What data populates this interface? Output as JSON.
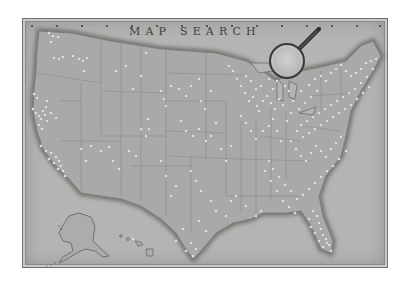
{
  "map": {
    "title": "MAP SEARCH",
    "colors": {
      "frame_bg": "#b4b4b2",
      "land": "#a9a9a7",
      "coast_shadow": "#6a6a68",
      "state_lines": "#8c8c8a",
      "pin": "#f2f2f0",
      "magnifier_handle": "#3a3a3a",
      "magnifier_lens": "#c4c4c2"
    },
    "scale_ticks": [
      "",
      "",
      "",
      "",
      "",
      "",
      "",
      "",
      "",
      "",
      "",
      "",
      "",
      "",
      ""
    ],
    "magnifier_icon": "magnifying-glass-icon",
    "regions": [
      "contiguous-us",
      "alaska",
      "hawaii"
    ],
    "pin_clusters": [
      {
        "region": "pacific-northwest",
        "pins": [
          [
            48,
            32
          ],
          [
            52,
            35
          ],
          [
            57,
            36
          ],
          [
            50,
            41
          ],
          [
            53,
            57
          ],
          [
            58,
            58
          ],
          [
            62,
            56
          ],
          [
            72,
            55
          ],
          [
            78,
            58
          ],
          [
            82,
            60
          ],
          [
            86,
            57
          ],
          [
            83,
            70
          ]
        ]
      },
      {
        "region": "california",
        "pins": [
          [
            33,
            93
          ],
          [
            36,
            97
          ],
          [
            32,
            108
          ],
          [
            35,
            112
          ],
          [
            38,
            115
          ],
          [
            40,
            118
          ],
          [
            42,
            110
          ],
          [
            44,
            114
          ],
          [
            46,
            120
          ],
          [
            38,
            124
          ],
          [
            41,
            128
          ],
          [
            45,
            106
          ],
          [
            50,
            112
          ],
          [
            55,
            117
          ],
          [
            46,
            100
          ],
          [
            40,
            145
          ],
          [
            45,
            150
          ],
          [
            50,
            152
          ],
          [
            55,
            156
          ],
          [
            58,
            160
          ],
          [
            60,
            165
          ],
          [
            62,
            170
          ],
          [
            57,
            168
          ],
          [
            53,
            162
          ],
          [
            48,
            158
          ],
          [
            64,
            175
          ]
        ]
      },
      {
        "region": "mountain-west",
        "pins": [
          [
            80,
            148
          ],
          [
            85,
            160
          ],
          [
            90,
            145
          ],
          [
            100,
            150
          ],
          [
            108,
            146
          ],
          [
            112,
            160
          ],
          [
            118,
            168
          ],
          [
            128,
            150
          ],
          [
            135,
            155
          ],
          [
            140,
            128
          ],
          [
            145,
            135
          ],
          [
            148,
            128
          ],
          [
            147,
            118
          ],
          [
            115,
            70
          ],
          [
            125,
            65
          ],
          [
            132,
            88
          ],
          [
            140,
            75
          ],
          [
            145,
            52
          ]
        ]
      },
      {
        "region": "plains",
        "pins": [
          [
            160,
            90
          ],
          [
            163,
            98
          ],
          [
            165,
            105
          ],
          [
            170,
            85
          ],
          [
            178,
            88
          ],
          [
            185,
            95
          ],
          [
            190,
            85
          ],
          [
            198,
            78
          ],
          [
            200,
            100
          ],
          [
            204,
            108
          ],
          [
            210,
            90
          ],
          [
            180,
            120
          ],
          [
            185,
            130
          ],
          [
            192,
            135
          ],
          [
            198,
            128
          ],
          [
            205,
            140
          ],
          [
            210,
            135
          ],
          [
            215,
            122
          ],
          [
            220,
            148
          ],
          [
            225,
            160
          ],
          [
            230,
            145
          ],
          [
            190,
            170
          ],
          [
            195,
            180
          ],
          [
            200,
            190
          ],
          [
            210,
            200
          ],
          [
            215,
            210
          ],
          [
            198,
            220
          ],
          [
            205,
            230
          ],
          [
            175,
            240
          ],
          [
            182,
            228
          ],
          [
            170,
            195
          ],
          [
            175,
            185
          ],
          [
            165,
            175
          ],
          [
            160,
            160
          ]
        ]
      },
      {
        "region": "texas-gulf",
        "pins": [
          [
            185,
            250
          ],
          [
            190,
            242
          ],
          [
            192,
            255
          ],
          [
            195,
            248
          ],
          [
            225,
            215
          ],
          [
            230,
            200
          ],
          [
            235,
            195
          ],
          [
            245,
            205
          ],
          [
            255,
            215
          ],
          [
            260,
            210
          ]
        ]
      },
      {
        "region": "midwest-great-lakes",
        "pins": [
          [
            228,
            65
          ],
          [
            232,
            70
          ],
          [
            236,
            78
          ],
          [
            240,
            85
          ],
          [
            244,
            92
          ],
          [
            248,
            100
          ],
          [
            252,
            96
          ],
          [
            256,
            105
          ],
          [
            258,
            110
          ],
          [
            262,
            100
          ],
          [
            266,
            95
          ],
          [
            270,
            102
          ],
          [
            274,
            108
          ],
          [
            278,
            98
          ],
          [
            282,
            104
          ],
          [
            272,
            88
          ],
          [
            276,
            80
          ],
          [
            280,
            75
          ],
          [
            268,
            78
          ],
          [
            260,
            85
          ],
          [
            255,
            88
          ],
          [
            250,
            80
          ],
          [
            245,
            75
          ],
          [
            240,
            115
          ],
          [
            245,
            122
          ],
          [
            250,
            130
          ],
          [
            255,
            138
          ],
          [
            262,
            130
          ],
          [
            268,
            125
          ],
          [
            272,
            118
          ],
          [
            276,
            130
          ],
          [
            280,
            140
          ],
          [
            286,
            120
          ],
          [
            290,
            112
          ],
          [
            284,
            85
          ],
          [
            288,
            90
          ]
        ]
      },
      {
        "region": "northeast",
        "pins": [
          [
            320,
            75
          ],
          [
            325,
            80
          ],
          [
            330,
            72
          ],
          [
            335,
            68
          ],
          [
            340,
            64
          ],
          [
            345,
            70
          ],
          [
            350,
            75
          ],
          [
            355,
            72
          ],
          [
            360,
            68
          ],
          [
            365,
            62
          ],
          [
            370,
            60
          ],
          [
            375,
            58
          ],
          [
            372,
            68
          ],
          [
            366,
            76
          ],
          [
            360,
            82
          ],
          [
            354,
            88
          ],
          [
            348,
            92
          ],
          [
            342,
            96
          ],
          [
            336,
            100
          ],
          [
            330,
            104
          ],
          [
            324,
            108
          ],
          [
            318,
            112
          ],
          [
            312,
            116
          ],
          [
            306,
            120
          ],
          [
            300,
            124
          ],
          [
            296,
            130
          ],
          [
            302,
            136
          ],
          [
            308,
            132
          ],
          [
            314,
            128
          ],
          [
            320,
            124
          ],
          [
            326,
            120
          ],
          [
            332,
            116
          ],
          [
            338,
            112
          ],
          [
            344,
            108
          ],
          [
            350,
            104
          ],
          [
            356,
            98
          ],
          [
            362,
            92
          ],
          [
            368,
            86
          ],
          [
            316,
            90
          ],
          [
            310,
            96
          ],
          [
            304,
            102
          ],
          [
            298,
            108
          ],
          [
            292,
            100
          ],
          [
            300,
            90
          ],
          [
            308,
            84
          ],
          [
            314,
            78
          ]
        ]
      },
      {
        "region": "southeast",
        "pins": [
          [
            290,
            140
          ],
          [
            295,
            148
          ],
          [
            300,
            155
          ],
          [
            305,
            160
          ],
          [
            310,
            152
          ],
          [
            315,
            145
          ],
          [
            320,
            150
          ],
          [
            325,
            156
          ],
          [
            330,
            148
          ],
          [
            335,
            142
          ],
          [
            340,
            136
          ],
          [
            345,
            150
          ],
          [
            338,
            158
          ],
          [
            332,
            165
          ],
          [
            326,
            170
          ],
          [
            320,
            176
          ],
          [
            314,
            182
          ],
          [
            308,
            188
          ],
          [
            302,
            194
          ],
          [
            296,
            198
          ],
          [
            290,
            190
          ],
          [
            284,
            184
          ],
          [
            278,
            176
          ],
          [
            272,
            168
          ],
          [
            268,
            160
          ],
          [
            264,
            170
          ],
          [
            270,
            180
          ],
          [
            276,
            190
          ],
          [
            282,
            200
          ],
          [
            288,
            206
          ],
          [
            294,
            212
          ]
        ]
      },
      {
        "region": "florida",
        "pins": [
          [
            312,
            210
          ],
          [
            316,
            215
          ],
          [
            318,
            222
          ],
          [
            320,
            228
          ],
          [
            322,
            234
          ],
          [
            325,
            238
          ],
          [
            328,
            244
          ],
          [
            330,
            250
          ],
          [
            326,
            242
          ],
          [
            322,
            246
          ],
          [
            318,
            240
          ],
          [
            314,
            232
          ],
          [
            310,
            226
          ],
          [
            308,
            218
          ]
        ]
      },
      {
        "region": "hawaii",
        "pins": [
          [
            132,
            238
          ]
        ]
      }
    ]
  }
}
